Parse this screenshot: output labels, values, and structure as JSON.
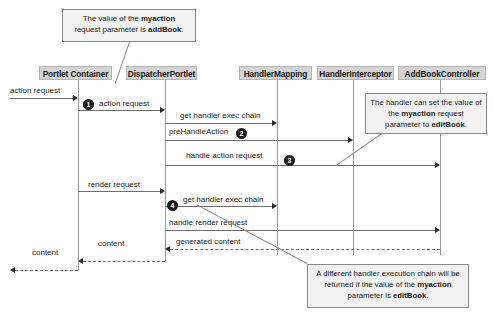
{
  "diagram": {
    "participants": [
      {
        "id": "portlet-container",
        "label": "Portlet Container"
      },
      {
        "id": "dispatcher-portlet",
        "label": "DispatcherPortlet"
      },
      {
        "id": "handler-mapping",
        "label": "HandlerMapping"
      },
      {
        "id": "handler-interceptor",
        "label": "HandlerInterceptor"
      },
      {
        "id": "addbook-controller",
        "label": "AddBookController"
      }
    ],
    "messages": [
      {
        "label": "action request",
        "from": "external",
        "to": "portlet-container",
        "style": "solid"
      },
      {
        "label": "action request",
        "from": "portlet-container",
        "to": "dispatcher-portlet",
        "style": "solid"
      },
      {
        "label": "get handler exec chain",
        "from": "dispatcher-portlet",
        "to": "handler-mapping",
        "style": "solid"
      },
      {
        "label": "preHandleAction",
        "from": "dispatcher-portlet",
        "to": "handler-interceptor",
        "style": "solid"
      },
      {
        "label": "handle action request",
        "from": "dispatcher-portlet",
        "to": "addbook-controller",
        "style": "solid"
      },
      {
        "label": "render request",
        "from": "portlet-container",
        "to": "dispatcher-portlet",
        "style": "solid"
      },
      {
        "label": "get handler exec chain",
        "from": "dispatcher-portlet",
        "to": "handler-mapping",
        "style": "solid"
      },
      {
        "label": "handle render request",
        "from": "dispatcher-portlet",
        "to": "addbook-controller",
        "style": "solid"
      },
      {
        "label": "generated content",
        "from": "addbook-controller",
        "to": "dispatcher-portlet",
        "style": "dashed"
      },
      {
        "label": "content",
        "from": "dispatcher-portlet",
        "to": "portlet-container",
        "style": "dashed"
      },
      {
        "label": "content",
        "from": "portlet-container",
        "to": "external",
        "style": "dashed"
      }
    ],
    "markers": [
      {
        "number": "1"
      },
      {
        "number": "2"
      },
      {
        "number": "3"
      },
      {
        "number": "4"
      }
    ],
    "notes": [
      {
        "id": "note-addbook",
        "text_parts": [
          "The value of the ",
          "myaction",
          " request parameter is ",
          "addBook",
          "."
        ]
      },
      {
        "id": "note-handler-sets",
        "text_parts": [
          "The handler can set the value of the ",
          "myaction",
          " request parameter to ",
          "editBook",
          "."
        ]
      },
      {
        "id": "note-different-chain",
        "text_parts": [
          "A different handler execution chain will be returned if the value of the ",
          "myaction",
          " parameter is ",
          "editBook",
          "."
        ]
      }
    ]
  }
}
